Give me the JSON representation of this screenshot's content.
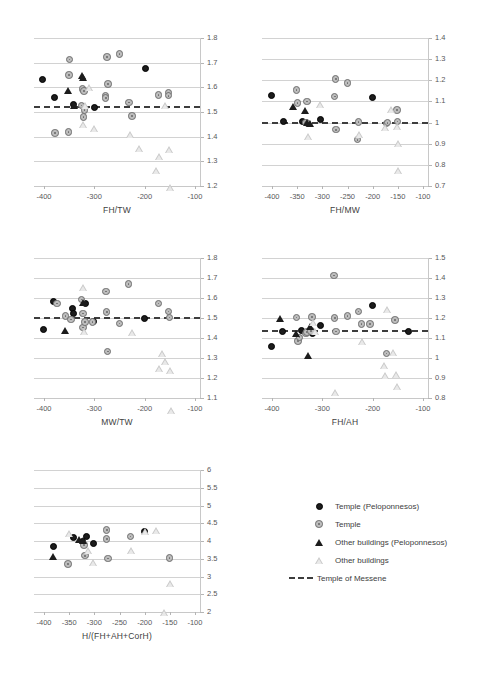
{
  "figure": {
    "background": "#ffffff",
    "colors": {
      "dark_marker": "#1c1c1c",
      "light_marker": "#bdbdbd",
      "gridline": "#d2d2d2",
      "reference_line": "#3d3d3d",
      "axis": "#c8c8c8",
      "text": "#3d3d3d"
    }
  },
  "legend": {
    "position": "bottom-right",
    "items": [
      {
        "marker": "filled-circle-icon",
        "label": "Temple (Peloponnesos)"
      },
      {
        "marker": "open-circle-icon",
        "label": "Temple"
      },
      {
        "marker": "filled-triangle-icon",
        "label": "Other buildings (Peloponnesos)"
      },
      {
        "marker": "open-triangle-icon",
        "label": "Other buildings"
      },
      {
        "marker": "dashed-line-icon",
        "label": "Temple of Messene"
      }
    ]
  },
  "chart_data": [
    {
      "id": "fh-tw",
      "type": "scatter",
      "title": "",
      "xlabel": "FH/TW",
      "ylabel": "",
      "xlim": [
        -420,
        -90
      ],
      "ylim": [
        1.2,
        1.8
      ],
      "xticks": [
        -400,
        -300,
        -200,
        -100
      ],
      "xticklabels": [
        "-400",
        "-300",
        "-200",
        "-100"
      ],
      "yticks": [
        1.2,
        1.3,
        1.4,
        1.5,
        1.6,
        1.7,
        1.8
      ],
      "yticklabels": [
        "1.2",
        "1.3",
        "1.4",
        "1.5",
        "1.6",
        "1.7",
        "1.8"
      ],
      "grid": true,
      "reference_line": {
        "value": 1.525,
        "label": "Temple of Messene"
      },
      "series": [
        {
          "name": "Temple (Peloponnesos)",
          "marker": "filled-circle",
          "points": [
            [
              -402,
              1.628
            ],
            [
              -378,
              1.555
            ],
            [
              -340,
              1.528
            ],
            [
              -299,
              1.515
            ],
            [
              -198,
              1.673
            ]
          ]
        },
        {
          "name": "Temple",
          "marker": "open-circle",
          "points": [
            [
              -378,
              1.413
            ],
            [
              -351,
              1.418
            ],
            [
              -349,
              1.712
            ],
            [
              -350,
              1.648
            ],
            [
              -323,
              1.592
            ],
            [
              -320,
              1.585
            ],
            [
              -321,
              1.478
            ],
            [
              -325,
              1.525
            ],
            [
              -319,
              1.507
            ],
            [
              -274,
              1.722
            ],
            [
              -272,
              1.612
            ],
            [
              -277,
              1.565
            ],
            [
              -277,
              1.555
            ],
            [
              -250,
              1.735
            ],
            [
              -231,
              1.538
            ],
            [
              -225,
              1.482
            ],
            [
              -172,
              1.568
            ],
            [
              -152,
              1.578
            ],
            [
              -152,
              1.565
            ]
          ]
        },
        {
          "name": "Other buildings (Peloponnesos)",
          "marker": "filled-triangle",
          "points": [
            [
              -352,
              1.588
            ],
            [
              -340,
              1.525
            ],
            [
              -325,
              1.648
            ],
            [
              -322,
              1.638
            ]
          ]
        },
        {
          "name": "Other buildings",
          "marker": "open-triangle",
          "points": [
            [
              -318,
              1.528
            ],
            [
              -323,
              1.478
            ],
            [
              -310,
              1.655
            ],
            [
              -300,
              1.518
            ],
            [
              -230,
              1.522
            ],
            [
              -212,
              1.492
            ],
            [
              -172,
              1.488
            ],
            [
              -178,
              1.462
            ],
            [
              -160,
              1.752
            ],
            [
              -152,
              1.602
            ],
            [
              -150,
              1.478
            ]
          ]
        }
      ]
    },
    {
      "id": "fh-mw",
      "type": "scatter",
      "title": "",
      "xlabel": "FH/MW",
      "ylabel": "",
      "xlim": [
        -420,
        -90
      ],
      "ylim": [
        0.7,
        1.4
      ],
      "xticks": [
        -400,
        -350,
        -300,
        -250,
        -200,
        -150,
        -100
      ],
      "xticklabels": [
        "-400",
        "-350",
        "-300",
        "-250",
        "-200",
        "-150",
        "-100"
      ],
      "yticks": [
        0.7,
        0.8,
        0.9,
        1.0,
        1.1,
        1.2,
        1.3,
        1.4
      ],
      "yticklabels": [
        "0.7",
        "0.8",
        "0.9",
        "1",
        "1.1",
        "1.2",
        "1.3",
        "1.4"
      ],
      "grid": true,
      "reference_line": {
        "value": 1.005,
        "label": "Temple of Messene"
      },
      "series": [
        {
          "name": "Temple (Peloponnesos)",
          "marker": "filled-circle",
          "points": [
            [
              -401,
              1.128
            ],
            [
              -377,
              1.002
            ],
            [
              -338,
              1.005
            ],
            [
              -302,
              1.012
            ],
            [
              -200,
              1.115
            ]
          ]
        },
        {
          "name": "Temple",
          "marker": "open-circle",
          "points": [
            [
              -351,
              1.152
            ],
            [
              -349,
              1.092
            ],
            [
              -330,
              1.098
            ],
            [
              -332,
              0.998
            ],
            [
              -329,
              0.995
            ],
            [
              -273,
              1.205
            ],
            [
              -275,
              1.122
            ],
            [
              -272,
              0.965
            ],
            [
              -250,
              1.185
            ],
            [
              -230,
              0.918
            ],
            [
              -228,
              1.002
            ],
            [
              -172,
              0.995
            ],
            [
              -170,
              0.998
            ],
            [
              -151,
              1.058
            ],
            [
              -150,
              1.005
            ]
          ]
        },
        {
          "name": "Other buildings (Peloponnesos)",
          "marker": "filled-triangle",
          "points": [
            [
              -358,
              1.075
            ],
            [
              -335,
              1.055
            ],
            [
              -331,
              0.998
            ],
            [
              -325,
              0.995
            ]
          ]
        },
        {
          "name": "Other buildings",
          "marker": "open-triangle",
          "points": [
            [
              -328,
              0.932
            ],
            [
              -305,
              1.118
            ],
            [
              -228,
              1.008
            ],
            [
              -175,
              1.078
            ],
            [
              -163,
              1.195
            ],
            [
              -152,
              1.148
            ],
            [
              -150,
              1.102
            ],
            [
              -150,
              1.005
            ]
          ]
        }
      ]
    },
    {
      "id": "mw-tw",
      "type": "scatter",
      "title": "",
      "xlabel": "MW/TW",
      "ylabel": "",
      "xlim": [
        -420,
        -90
      ],
      "ylim": [
        1.1,
        1.8
      ],
      "xticks": [
        -400,
        -300,
        -200,
        -100
      ],
      "xticklabels": [
        "-400",
        "-300",
        "-200",
        "-100"
      ],
      "yticks": [
        1.1,
        1.2,
        1.3,
        1.4,
        1.5,
        1.6,
        1.7,
        1.8
      ],
      "yticklabels": [
        "1.1",
        "1.2",
        "1.3",
        "1.4",
        "1.5",
        "1.6",
        "1.7",
        "1.8"
      ],
      "grid": true,
      "reference_line": {
        "value": 1.503,
        "label": "Temple of Messene"
      },
      "series": [
        {
          "name": "Temple (Peloponnesos)",
          "marker": "filled-circle",
          "points": [
            [
              -401,
              1.438
            ],
            [
              -380,
              1.578
            ],
            [
              -343,
              1.545
            ],
            [
              -340,
              1.522
            ],
            [
              -316,
              1.568
            ],
            [
              -301,
              1.478
            ],
            [
              -200,
              1.495
            ]
          ]
        },
        {
          "name": "Temple",
          "marker": "open-circle",
          "points": [
            [
              -374,
              1.572
            ],
            [
              -357,
              1.508
            ],
            [
              -346,
              1.492
            ],
            [
              -325,
              1.592
            ],
            [
              -322,
              1.522
            ],
            [
              -322,
              1.452
            ],
            [
              -318,
              1.478
            ],
            [
              -303,
              1.478
            ],
            [
              -276,
              1.632
            ],
            [
              -275,
              1.528
            ],
            [
              -273,
              1.332
            ],
            [
              -250,
              1.472
            ],
            [
              -232,
              1.668
            ],
            [
              -172,
              1.572
            ],
            [
              -152,
              1.532
            ],
            [
              -150,
              1.502
            ]
          ]
        },
        {
          "name": "Other buildings (Peloponnesos)",
          "marker": "filled-triangle",
          "points": [
            [
              -358,
              1.438
            ],
            [
              -322,
              1.578
            ]
          ]
        },
        {
          "name": "Other buildings",
          "marker": "open-triangle",
          "points": [
            [
              -322,
              1.652
            ],
            [
              -320,
              1.468
            ],
            [
              -226,
              1.498
            ],
            [
              -172,
              1.352
            ],
            [
              -165,
              1.462
            ],
            [
              -160,
              1.458
            ],
            [
              -150,
              1.448
            ],
            [
              -148,
              1.282
            ]
          ]
        }
      ]
    },
    {
      "id": "fh-ah",
      "type": "scatter",
      "title": "",
      "xlabel": "FH/AH",
      "ylabel": "",
      "xlim": [
        -420,
        -90
      ],
      "ylim": [
        0.8,
        1.5
      ],
      "xticks": [
        -400,
        -300,
        -200,
        -100
      ],
      "xticklabels": [
        "-400",
        "-300",
        "-200",
        "-100"
      ],
      "yticks": [
        0.8,
        0.9,
        1.0,
        1.1,
        1.2,
        1.3,
        1.4,
        1.5
      ],
      "yticklabels": [
        "0.8",
        "0.9",
        "1",
        "1.1",
        "1.2",
        "1.3",
        "1.4",
        "1.5"
      ],
      "grid": true,
      "reference_line": {
        "value": 1.142,
        "label": "Temple of Messene"
      },
      "series": [
        {
          "name": "Temple (Peloponnesos)",
          "marker": "filled-circle",
          "points": [
            [
              -401,
              1.055
            ],
            [
              -378,
              1.132
            ],
            [
              -340,
              1.135
            ],
            [
              -318,
              1.122
            ],
            [
              -302,
              1.158
            ],
            [
              -200,
              1.258
            ],
            [
              -128,
              1.128
            ]
          ]
        },
        {
          "name": "Temple",
          "marker": "open-circle",
          "points": [
            [
              -351,
              1.202
            ],
            [
              -348,
              1.085
            ],
            [
              -345,
              1.102
            ],
            [
              -332,
              1.122
            ],
            [
              -330,
              1.128
            ],
            [
              -320,
              1.205
            ],
            [
              -322,
              1.135
            ],
            [
              -276,
              1.412
            ],
            [
              -275,
              1.198
            ],
            [
              -272,
              1.132
            ],
            [
              -250,
              1.208
            ],
            [
              -228,
              1.232
            ],
            [
              -222,
              1.168
            ],
            [
              -205,
              1.168
            ],
            [
              -172,
              1.022
            ],
            [
              -155,
              1.188
            ]
          ]
        },
        {
          "name": "Other buildings (Peloponnesos)",
          "marker": "filled-triangle",
          "points": [
            [
              -385,
              1.198
            ],
            [
              -352,
              1.122
            ],
            [
              -328,
              1.012
            ],
            [
              -325,
              1.158
            ]
          ]
        },
        {
          "name": "Other buildings",
          "marker": "open-triangle",
          "points": [
            [
              -318,
              1.178
            ],
            [
              -315,
              1.168
            ],
            [
              -275,
              0.898
            ],
            [
              -222,
              1.188
            ],
            [
              -178,
              1.102
            ],
            [
              -176,
              1.088
            ],
            [
              -172,
              1.452
            ],
            [
              -160,
              1.272
            ],
            [
              -153,
              1.198
            ],
            [
              -152,
              1.175
            ]
          ]
        }
      ]
    },
    {
      "id": "h-fh-ah-corh",
      "type": "scatter",
      "title": "",
      "xlabel": "H/(FH+AH+CorH)",
      "ylabel": "",
      "xlim": [
        -420,
        -90
      ],
      "ylim": [
        2,
        6
      ],
      "xticks": [
        -400,
        -350,
        -300,
        -250,
        -200,
        -150,
        -100
      ],
      "xticklabels": [
        "-400",
        "-350",
        "-300",
        "-250",
        "-200",
        "-150",
        "-100"
      ],
      "yticks": [
        2,
        2.5,
        3,
        3.5,
        4,
        4.5,
        5,
        5.5,
        6
      ],
      "yticklabels": [
        "2",
        "2.5",
        "3",
        "3.5",
        "4",
        "4.5",
        "5",
        "5.5",
        "6"
      ],
      "grid": true,
      "reference_line": null,
      "series": [
        {
          "name": "Temple (Peloponnesos)",
          "marker": "filled-circle",
          "points": [
            [
              -380,
              3.82
            ],
            [
              -340,
              4.08
            ],
            [
              -322,
              3.98
            ],
            [
              -315,
              4.12
            ],
            [
              -300,
              3.92
            ],
            [
              -200,
              4.25
            ]
          ]
        },
        {
          "name": "Temple",
          "marker": "open-circle",
          "points": [
            [
              -352,
              3.35
            ],
            [
              -318,
              3.58
            ],
            [
              -320,
              3.88
            ],
            [
              -275,
              4.3
            ],
            [
              -275,
              4.05
            ],
            [
              -272,
              3.5
            ],
            [
              -228,
              4.12
            ],
            [
              -150,
              3.52
            ]
          ]
        },
        {
          "name": "Other buildings (Peloponnesos)",
          "marker": "filled-triangle",
          "points": [
            [
              -382,
              3.55
            ],
            [
              -330,
              4.05
            ],
            [
              -322,
              4.02
            ]
          ]
        },
        {
          "name": "Other buildings",
          "marker": "open-triangle",
          "points": [
            [
              -350,
              4.2
            ],
            [
              -312,
              3.92
            ],
            [
              -302,
              3.78
            ],
            [
              -228,
              4.32
            ],
            [
              -200,
              5.05
            ],
            [
              -178,
              5.28
            ],
            [
              -162,
              3.18
            ],
            [
              -150,
              4.18
            ]
          ]
        }
      ]
    }
  ]
}
